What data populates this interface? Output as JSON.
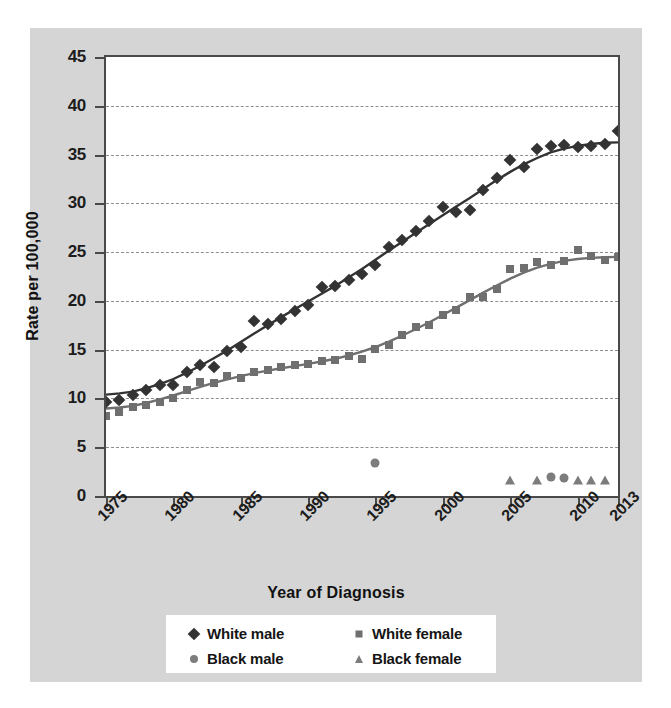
{
  "chart_data": {
    "type": "scatter",
    "title": "",
    "xlabel": "Year of Diagnosis",
    "ylabel": "Rate per 100,000",
    "xlim": [
      1975,
      2013
    ],
    "ylim": [
      0,
      45
    ],
    "xticks": [
      "1975",
      "1980",
      "1985",
      "1990",
      "1995",
      "2000",
      "2005",
      "2010",
      "2013"
    ],
    "xtick_values": [
      1975,
      1980,
      1985,
      1990,
      1995,
      2000,
      2005,
      2010,
      2013
    ],
    "yticks": [
      "0",
      "5",
      "10",
      "15",
      "20",
      "25",
      "30",
      "35",
      "40",
      "45"
    ],
    "ytick_values": [
      0,
      5,
      10,
      15,
      20,
      25,
      30,
      35,
      40,
      45
    ],
    "grid": "horizontal-dashed",
    "legend_position": "bottom",
    "colors": {
      "white_male": "#333333",
      "white_female": "#6f6f6f",
      "black_male": "#7c7c7c",
      "black_female": "#7c7c7c",
      "panel_background": "#d5d5d5",
      "plot_background": "#ffffff",
      "axis": "#4a4a4a",
      "gridline": "#8e8e8e"
    },
    "series": [
      {
        "name": "White male",
        "marker": "diamond",
        "has_trendline": true,
        "x": [
          1975,
          1976,
          1977,
          1978,
          1979,
          1980,
          1981,
          1982,
          1983,
          1984,
          1985,
          1986,
          1987,
          1988,
          1989,
          1990,
          1991,
          1992,
          1993,
          1994,
          1995,
          1996,
          1997,
          1998,
          1999,
          2000,
          2001,
          2002,
          2003,
          2004,
          2005,
          2006,
          2007,
          2008,
          2009,
          2010,
          2011,
          2012,
          2013
        ],
        "y": [
          9.6,
          9.8,
          10.4,
          10.9,
          11.4,
          11.4,
          12.7,
          13.4,
          13.2,
          14.9,
          15.3,
          17.9,
          17.6,
          18.1,
          19.0,
          19.6,
          21.4,
          21.5,
          22.1,
          22.8,
          23.7,
          25.5,
          26.2,
          27.2,
          28.2,
          29.6,
          29.1,
          29.3,
          31.4,
          32.6,
          34.4,
          33.7,
          35.6,
          35.9,
          36.0,
          35.8,
          35.9,
          36.1,
          37.4
        ]
      },
      {
        "name": "White female",
        "marker": "square",
        "has_trendline": true,
        "x": [
          1975,
          1976,
          1977,
          1978,
          1979,
          1980,
          1981,
          1982,
          1983,
          1984,
          1985,
          1986,
          1987,
          1988,
          1989,
          1990,
          1991,
          1992,
          1993,
          1994,
          1995,
          1996,
          1997,
          1998,
          1999,
          2000,
          2001,
          2002,
          2003,
          2004,
          2005,
          2006,
          2007,
          2008,
          2009,
          2010,
          2011,
          2012,
          2013
        ],
        "y": [
          8.2,
          8.6,
          9.1,
          9.3,
          9.6,
          10.0,
          10.9,
          11.7,
          11.6,
          12.3,
          12.1,
          12.7,
          12.9,
          13.2,
          13.4,
          13.5,
          13.8,
          13.9,
          14.3,
          14.0,
          15.1,
          15.5,
          16.5,
          17.3,
          17.5,
          18.6,
          19.1,
          20.4,
          20.4,
          21.2,
          23.3,
          23.4,
          24.0,
          23.7,
          24.1,
          25.2,
          24.6,
          24.2,
          24.5
        ]
      },
      {
        "name": "Black male",
        "marker": "circle",
        "has_trendline": false,
        "x": [
          1995,
          2008,
          2009
        ],
        "y": [
          3.4,
          1.9,
          1.8
        ]
      },
      {
        "name": "Black female",
        "marker": "triangle",
        "has_trendline": false,
        "x": [
          2005,
          2007,
          2010,
          2011,
          2012
        ],
        "y": [
          1.6,
          1.6,
          1.6,
          1.6,
          1.6
        ]
      }
    ]
  },
  "legend": {
    "items": [
      {
        "label": "White male",
        "marker": "diamond",
        "color": "#333333"
      },
      {
        "label": "White female",
        "marker": "square",
        "color": "#6f6f6f"
      },
      {
        "label": "Black male",
        "marker": "circle",
        "color": "#7c7c7c"
      },
      {
        "label": "Black female",
        "marker": "triangle",
        "color": "#7c7c7c"
      }
    ]
  }
}
